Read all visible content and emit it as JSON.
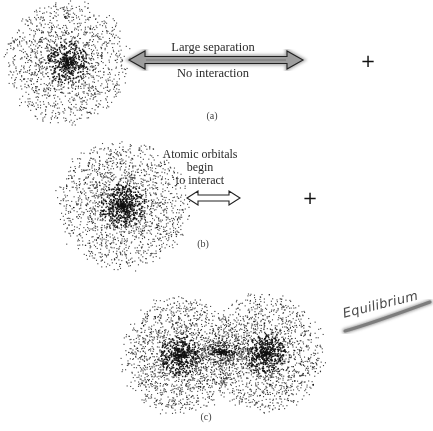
{
  "figure": {
    "panels": [
      {
        "id": "a",
        "caption": "(a)",
        "arrow_label_top": "Large separation",
        "arrow_label_bottom": "No interaction",
        "arrow_style": "shaded double-headed arrow",
        "nucleus_marker": "+"
      },
      {
        "id": "b",
        "caption": "(b)",
        "arrow_label_lines": [
          "Atomic orbitals",
          "begin",
          "to interact"
        ],
        "arrow_style": "hollow double-headed arrow",
        "nucleus_marker": "+"
      },
      {
        "id": "c",
        "caption": "(c)",
        "annotation": "Equilibrium",
        "annotation_style": "handwritten with gray highlighter underline"
      }
    ],
    "colors": {
      "dots": "#111111",
      "arrow_fill": "#9a9a9a",
      "arrow_outline": "#222222",
      "highlighter": "#8c8c8c",
      "background": "#ffffff"
    },
    "clouds": [
      {
        "name": "cloud-a",
        "cx": 67,
        "cy": 62,
        "rx": 64,
        "ry": 66,
        "n": 1700,
        "seed": 11
      },
      {
        "name": "cloud-b",
        "cx": 122,
        "cy": 205,
        "rx": 70,
        "ry": 68,
        "n": 2100,
        "seed": 23
      },
      {
        "name": "cloud-c-left",
        "cx": 180,
        "cy": 355,
        "rx": 62,
        "ry": 62,
        "n": 1900,
        "seed": 37
      },
      {
        "name": "cloud-c-right",
        "cx": 265,
        "cy": 352,
        "rx": 62,
        "ry": 62,
        "n": 1900,
        "seed": 53
      },
      {
        "name": "cloud-c-bond",
        "cx": 222,
        "cy": 352,
        "rx": 40,
        "ry": 12,
        "n": 350,
        "seed": 71
      }
    ]
  }
}
